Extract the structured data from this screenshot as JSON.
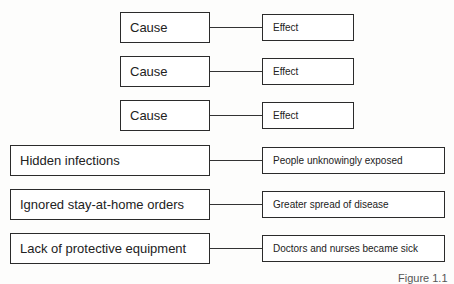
{
  "template_rows": [
    {
      "cause": "Cause",
      "effect": "Effect"
    },
    {
      "cause": "Cause",
      "effect": "Effect"
    },
    {
      "cause": "Cause",
      "effect": "Effect"
    }
  ],
  "filled_rows": [
    {
      "cause": "Hidden infections",
      "effect": "People unknowingly exposed"
    },
    {
      "cause": "Ignored stay-at-home orders",
      "effect": "Greater spread of disease"
    },
    {
      "cause": "Lack of protective equipment",
      "effect": "Doctors and nurses became sick"
    }
  ],
  "caption": "Figure 1.1"
}
